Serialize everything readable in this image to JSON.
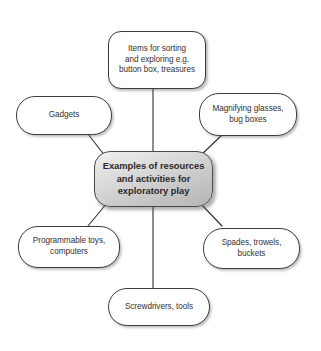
{
  "diagram": {
    "type": "mind-map",
    "center": {
      "id": "center",
      "label": "Examples of resources\nand activities for\nexploratory play",
      "x": 94,
      "y": 151,
      "width": 119,
      "height": 56,
      "radius": 16,
      "fill_start": "#f2f2f2",
      "fill_end": "#b6b6b6",
      "border_color": "#4a4a4a",
      "text_color": "#2b2a2a",
      "bold": true
    },
    "nodes": [
      {
        "id": "top",
        "label": "Items for sorting\nand exploring e.g.\nbutton box, treasures",
        "x": 108,
        "y": 31,
        "width": 98,
        "height": 58,
        "radius": 13
      },
      {
        "id": "upper-right",
        "label": "Magnifying glasses,\nbug boxes",
        "x": 199,
        "y": 93,
        "width": 98,
        "height": 43,
        "radius": 20
      },
      {
        "id": "left",
        "label": "Gadgets",
        "x": 16,
        "y": 96,
        "width": 96,
        "height": 39,
        "radius": 19
      },
      {
        "id": "lower-left",
        "label": "Programmable toys,\ncomputers",
        "x": 18,
        "y": 226,
        "width": 102,
        "height": 42,
        "radius": 20
      },
      {
        "id": "lower-right",
        "label": "Spades, trowels,\nbuckets",
        "x": 203,
        "y": 228,
        "width": 97,
        "height": 41,
        "radius": 20
      },
      {
        "id": "bottom",
        "label": "Screwdrivers, tools",
        "x": 108,
        "y": 288,
        "width": 102,
        "height": 38,
        "radius": 19
      }
    ],
    "edges": [
      {
        "id": "edge-center-top",
        "from": "center",
        "to": "top",
        "x1": 153,
        "y1": 151,
        "x2": 153,
        "y2": 89
      },
      {
        "id": "edge-center-upper-right",
        "from": "center",
        "to": "upper-right",
        "x1": 200,
        "y1": 156,
        "x2": 222,
        "y2": 135
      },
      {
        "id": "edge-center-left",
        "from": "center",
        "to": "left",
        "x1": 105,
        "y1": 156,
        "x2": 88,
        "y2": 134
      },
      {
        "id": "edge-center-lower-left",
        "from": "center",
        "to": "lower-left",
        "x1": 107,
        "y1": 203,
        "x2": 88,
        "y2": 226
      },
      {
        "id": "edge-center-lower-right",
        "from": "center",
        "to": "lower-right",
        "x1": 200,
        "y1": 203,
        "x2": 222,
        "y2": 226
      },
      {
        "id": "edge-center-bottom",
        "from": "center",
        "to": "bottom",
        "x1": 153,
        "y1": 207,
        "x2": 153,
        "y2": 288
      }
    ],
    "edge_color": "#2f2f2f",
    "edge_width": 1.1,
    "background": "#ffffff"
  }
}
